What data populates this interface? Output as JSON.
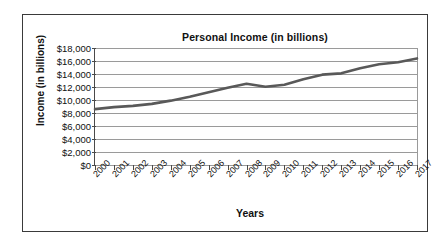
{
  "chart_data": {
    "type": "line",
    "title": "Personal Income (in billions)",
    "xlabel": "Years",
    "ylabel": "Income (in billions)",
    "grid": true,
    "legend": "none",
    "xlim": [
      2000,
      2017
    ],
    "ylim": [
      0,
      18000
    ],
    "ytick_step": 2000,
    "ytick_labels": [
      "$18,000",
      "$16,000",
      "$14,000",
      "$12,000",
      "$10,000",
      "$8,000",
      "$6,000",
      "$4,000",
      "$2,000",
      "$0"
    ],
    "ytick_values": [
      18000,
      16000,
      14000,
      12000,
      10000,
      8000,
      6000,
      4000,
      2000,
      0
    ],
    "categories": [
      "2000",
      "2001",
      "2002",
      "2003",
      "2004",
      "2005",
      "2006",
      "2007",
      "2008",
      "2009",
      "2010",
      "2011",
      "2012",
      "2013",
      "2014",
      "2015",
      "2016",
      "2017"
    ],
    "series": [
      {
        "name": "Personal Income",
        "color": "#595959",
        "values": [
          8600,
          8900,
          9100,
          9400,
          9900,
          10500,
          11200,
          11900,
          12500,
          12050,
          12350,
          13200,
          13900,
          14100,
          14900,
          15500,
          15800,
          16400
        ]
      }
    ]
  },
  "colors": {
    "line": "#595959",
    "grid": "#9a9a9a",
    "axis": "#4a4a4a",
    "border": "#3a3a3a",
    "text": "#111111",
    "background": "#ffffff"
  }
}
